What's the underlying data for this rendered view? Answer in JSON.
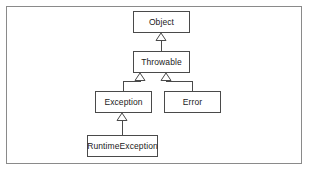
{
  "figure": {
    "background_color": "#ffffff",
    "frame": {
      "border_color": "#8a8a8a",
      "x": 6,
      "y": 6,
      "width": 296,
      "height": 158
    }
  },
  "diagram": {
    "type": "uml-class-hierarchy",
    "relationship": "generalization",
    "box_border_color": "#4a4a4a",
    "box_fill_color": "#ffffff",
    "line_color": "#4a4a4a",
    "text_color": "#1a1a1a",
    "nodes": [
      {
        "id": "object",
        "label": "Object",
        "x": 133,
        "y": 11,
        "width": 57,
        "height": 22
      },
      {
        "id": "throwable",
        "label": "Throwable",
        "x": 133,
        "y": 51,
        "width": 57,
        "height": 22
      },
      {
        "id": "exception",
        "label": "Exception",
        "x": 95,
        "y": 91,
        "width": 57,
        "height": 22
      },
      {
        "id": "error",
        "label": "Error",
        "x": 164,
        "y": 91,
        "width": 57,
        "height": 22
      },
      {
        "id": "runtimeexception",
        "label": "RuntimeException",
        "x": 87,
        "y": 135,
        "width": 71,
        "height": 22
      }
    ],
    "edges": [
      {
        "id": "throwable-to-object",
        "from": "throwable",
        "to": "object",
        "arrow": "hollow-triangle"
      },
      {
        "id": "exception-to-throwable",
        "from": "exception",
        "to": "throwable",
        "arrow": "hollow-triangle"
      },
      {
        "id": "error-to-throwable",
        "from": "error",
        "to": "throwable",
        "arrow": "hollow-triangle"
      },
      {
        "id": "runtimeexception-to-exception",
        "from": "runtimeexception",
        "to": "exception",
        "arrow": "hollow-triangle"
      }
    ]
  }
}
